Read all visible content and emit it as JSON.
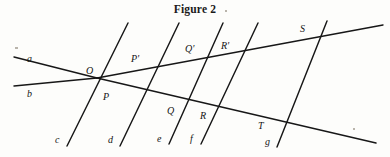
{
  "figure": {
    "caption": "Figure 2",
    "width": 390,
    "height": 157,
    "background_color": "#fdfdfb",
    "ink_color": "#171717"
  },
  "chart_data": {
    "type": "diagram",
    "subtype": "euclidean-geometry-transversals",
    "title": "Figure 2",
    "coordinate_space": {
      "units": "pixels",
      "origin": "top-left",
      "width": 390,
      "height": 157
    },
    "lines": [
      {
        "id": "a",
        "label": "a",
        "role": "ray-upper-left",
        "x1": 14,
        "y1": 57,
        "x2": 97,
        "y2": 78
      },
      {
        "id": "a2",
        "label": "",
        "role": "ray-upper-right",
        "x1": 97,
        "y1": 78,
        "x2": 383,
        "y2": 25
      },
      {
        "id": "b",
        "label": "b",
        "role": "ray-lower-left",
        "x1": 14,
        "y1": 86,
        "x2": 97,
        "y2": 78
      },
      {
        "id": "b2",
        "label": "",
        "role": "ray-lower-right",
        "x1": 97,
        "y1": 78,
        "x2": 376,
        "y2": 143
      },
      {
        "id": "c",
        "label": "c",
        "role": "transversal",
        "x1": 67,
        "y1": 146,
        "x2": 128,
        "y2": 23
      },
      {
        "id": "d",
        "label": "d",
        "role": "transversal",
        "x1": 120,
        "y1": 146,
        "x2": 179,
        "y2": 23
      },
      {
        "id": "e",
        "label": "e",
        "role": "transversal",
        "x1": 169,
        "y1": 144,
        "x2": 223,
        "y2": 23
      },
      {
        "id": "f",
        "label": "f",
        "role": "transversal",
        "x1": 201,
        "y1": 144,
        "x2": 258,
        "y2": 23
      },
      {
        "id": "g",
        "label": "g",
        "role": "transversal",
        "x1": 277,
        "y1": 147,
        "x2": 327,
        "y2": 21
      }
    ],
    "points": [
      {
        "id": "O",
        "label": "O",
        "x": 97,
        "y": 78,
        "label_x": 86,
        "label_y": 66
      },
      {
        "id": "P",
        "label": "P",
        "x": 112,
        "y": 96,
        "label_x": 103,
        "label_y": 92
      },
      {
        "id": "Pp",
        "label": "P'",
        "x": 143,
        "y": 68,
        "label_x": 131,
        "label_y": 54
      },
      {
        "id": "Q",
        "label": "Q",
        "x": 177,
        "y": 111,
        "label_x": 167,
        "label_y": 106
      },
      {
        "id": "Qp",
        "label": "Q'",
        "x": 197,
        "y": 58,
        "label_x": 185,
        "label_y": 44
      },
      {
        "id": "R",
        "label": "R",
        "x": 210,
        "y": 118,
        "label_x": 200,
        "label_y": 111
      },
      {
        "id": "Rp",
        "label": "R'",
        "x": 232,
        "y": 53,
        "label_x": 221,
        "label_y": 41
      },
      {
        "id": "S",
        "label": "S",
        "x": 307,
        "y": 39,
        "label_x": 300,
        "label_y": 24
      },
      {
        "id": "T",
        "label": "T",
        "x": 271,
        "y": 119,
        "label_x": 258,
        "label_y": 121
      }
    ],
    "line_labels": [
      {
        "id": "a",
        "label": "a",
        "label_x": 27,
        "label_y": 54
      },
      {
        "id": "b",
        "label": "b",
        "label_x": 27,
        "label_y": 89
      },
      {
        "id": "c",
        "label": "c",
        "label_x": 55,
        "label_y": 135
      },
      {
        "id": "d",
        "label": "d",
        "label_x": 108,
        "label_y": 135
      },
      {
        "id": "e",
        "label": "e",
        "label_x": 157,
        "label_y": 134
      },
      {
        "id": "f",
        "label": "f",
        "label_x": 190,
        "label_y": 134
      },
      {
        "id": "g",
        "label": "g",
        "label_x": 265,
        "label_y": 137
      }
    ],
    "specks": [
      {
        "x": 15,
        "y": 47,
        "w": 3,
        "h": 2
      },
      {
        "x": 225,
        "y": 10,
        "w": 2,
        "h": 2
      },
      {
        "x": 353,
        "y": 128,
        "w": 2,
        "h": 2
      }
    ]
  }
}
